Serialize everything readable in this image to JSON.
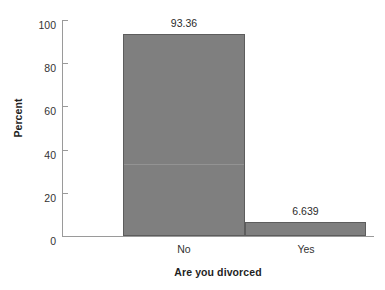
{
  "chart_data": {
    "type": "bar",
    "title": "",
    "subtitle": "",
    "xlabel": "Are you divorced",
    "ylabel": "Percent",
    "categories": [
      "No",
      "Yes"
    ],
    "values": [
      93.36,
      6.639
    ],
    "value_labels": [
      "93.36",
      "6.639"
    ],
    "ylim": [
      0,
      100
    ],
    "yticks": [
      0,
      20,
      40,
      60,
      80,
      100
    ],
    "ytick_labels": [
      "0",
      "20",
      "40",
      "60",
      "80",
      "100"
    ],
    "grid": false,
    "legend": null,
    "legend_position": "none",
    "series": [
      {
        "name": "Percent",
        "values": [
          93.36,
          6.639
        ],
        "color": "#7f7f7f",
        "edge_color": "#5d5d5d"
      }
    ],
    "annotations": []
  },
  "style": {
    "background": "#ffffff",
    "axis_color": "#9a9a9a",
    "text_color": "#333333",
    "title_color": "#1f1f1f",
    "bar_fill": "#7f7f7f",
    "bar_edge": "#5d5d5d"
  }
}
